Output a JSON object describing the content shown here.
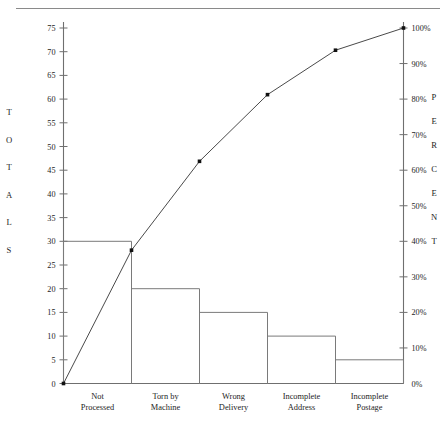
{
  "chart_data": {
    "type": "bar",
    "title": "",
    "subtitle": "",
    "categories": [
      "Not Processed",
      "Torn by Machine",
      "Wrong Delivery",
      "Incomplete Address",
      "Incomplete Postage"
    ],
    "category_lines": [
      [
        "Not",
        "Processed"
      ],
      [
        "Torn by",
        "Machine"
      ],
      [
        "Wrong",
        "Delivery"
      ],
      [
        "Incomplete",
        "Address"
      ],
      [
        "Incomplete",
        "Postage"
      ]
    ],
    "values": [
      30,
      20,
      15,
      10,
      5
    ],
    "cumulative_percent": [
      37.5,
      62.5,
      81.25,
      93.75,
      100
    ],
    "series": [
      {
        "name": "Totals",
        "type": "bar",
        "values": [
          30,
          20,
          15,
          10,
          5
        ]
      },
      {
        "name": "Cumulative Percent",
        "type": "line",
        "values": [
          37.5,
          62.5,
          81.25,
          93.75,
          100
        ]
      }
    ],
    "total": 80,
    "xlabel": "",
    "ylabel": "TOTALS",
    "y2label": "PERCENT",
    "ylim": [
      0,
      75
    ],
    "y2lim": [
      0,
      100
    ],
    "ytick_step": 5,
    "y2tick_step": 10,
    "yticks": [
      0,
      5,
      10,
      15,
      20,
      25,
      30,
      35,
      40,
      45,
      50,
      55,
      60,
      65,
      70,
      75
    ],
    "ytick_labels": [
      "0",
      "5",
      "10",
      "15",
      "20",
      "25",
      "30",
      "35",
      "40",
      "45",
      "50",
      "55",
      "60",
      "65",
      "70",
      "75"
    ],
    "y2ticks": [
      0,
      10,
      20,
      30,
      40,
      50,
      60,
      70,
      80,
      90,
      100
    ],
    "y2tick_labels": [
      "0%",
      "10%",
      "20%",
      "30%",
      "40%",
      "50%",
      "60%",
      "70%",
      "80%",
      "90%",
      "100%"
    ],
    "grid": false,
    "legend": "none",
    "line_starts_at_origin": true,
    "colors": {
      "bar_stroke": "#7a7a7a",
      "line": "#4a4a4a",
      "marker": "#111111",
      "axis": "#6f6f6f",
      "text": "#1d1d1d",
      "background": "#ffffff",
      "rule": "#8a8a8a"
    }
  },
  "axes": {
    "left_title_letters": [
      "T",
      "O",
      "T",
      "A",
      "L",
      "S"
    ],
    "right_title_letters": [
      "P",
      "E",
      "R",
      "C",
      "E",
      "N",
      "T"
    ]
  }
}
